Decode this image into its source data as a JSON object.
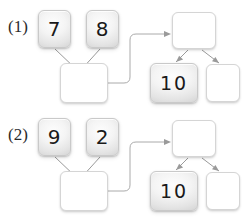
{
  "figure": {
    "type": "diagram",
    "width": 248,
    "height": 219,
    "background_color": "#ffffff"
  },
  "style": {
    "filled_node_fill": "#e4e4e4",
    "filled_node_border": "#c9c9c9",
    "empty_node_fill": "#ffffff",
    "empty_node_border": "#d5d5d5",
    "edge_color": "#9a9a9a",
    "text_color": "#1a1a1a",
    "label_color": "#2b2b2b"
  },
  "rows": [
    {
      "id": "row-1",
      "label": "(1)",
      "left_group": {
        "children": [
          {
            "id": "r1-leaf-a",
            "value": "7",
            "filled": true
          },
          {
            "id": "r1-leaf-b",
            "value": "8",
            "filled": true
          }
        ],
        "parent": {
          "id": "r1-parent",
          "value": "",
          "filled": false
        }
      },
      "right_group": {
        "root": {
          "id": "r1-root",
          "value": "",
          "filled": false
        },
        "children": [
          {
            "id": "r1-child-ten",
            "value": "10",
            "filled": true
          },
          {
            "id": "r1-child-blank",
            "value": "",
            "filled": false
          }
        ]
      },
      "connector": {
        "from": "r1-parent",
        "to": "r1-root",
        "arrow": true
      }
    },
    {
      "id": "row-2",
      "label": "(2)",
      "left_group": {
        "children": [
          {
            "id": "r2-leaf-a",
            "value": "9",
            "filled": true
          },
          {
            "id": "r2-leaf-b",
            "value": "2",
            "filled": true
          }
        ],
        "parent": {
          "id": "r2-parent",
          "value": "",
          "filled": false
        }
      },
      "right_group": {
        "root": {
          "id": "r2-root",
          "value": "",
          "filled": false
        },
        "children": [
          {
            "id": "r2-child-ten",
            "value": "10",
            "filled": true
          },
          {
            "id": "r2-child-blank",
            "value": "",
            "filled": false
          }
        ]
      },
      "connector": {
        "from": "r2-parent",
        "to": "r2-root",
        "arrow": true
      }
    }
  ]
}
